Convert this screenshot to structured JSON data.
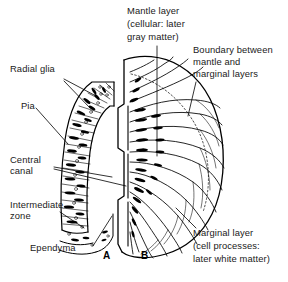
{
  "figure": {
    "background_color": "#ffffff",
    "ink_color": "#000000",
    "text_color": "#1a1a1a"
  },
  "labels": {
    "radial_glia": "Radial glia",
    "pia": "Pia",
    "central_canal_line1": "Central",
    "central_canal_line2": "canal",
    "intermediate_zone_line1": "Intermediate",
    "intermediate_zone_line2": "zone",
    "ependyma": "Ependyma",
    "mantle_layer_line1": "Mantle layer",
    "mantle_layer_line2": "(cellular: later",
    "mantle_layer_line3": "gray matter)",
    "boundary_line1": "Boundary between",
    "boundary_line2": "mantle and",
    "boundary_line3": "marginal layers",
    "marginal_layer_line1": "Marginal layer",
    "marginal_layer_line2": "(cell processes:",
    "marginal_layer_line3": "later white matter)"
  },
  "panels": {
    "a": "A",
    "b": "B"
  }
}
